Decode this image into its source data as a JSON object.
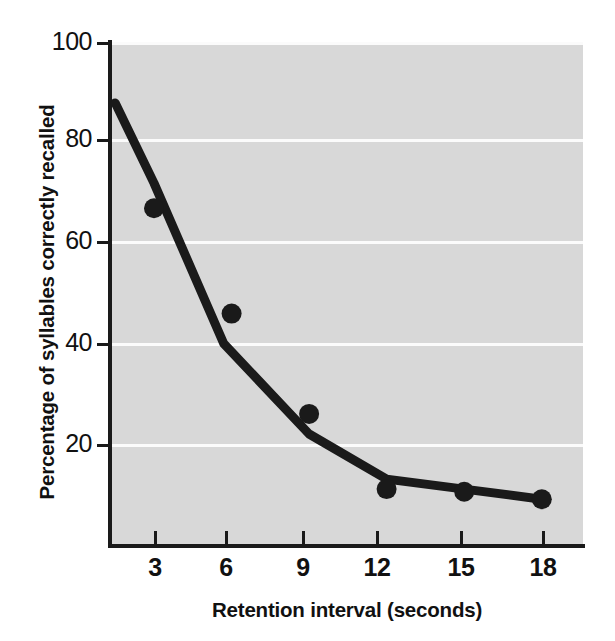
{
  "chart_data": {
    "type": "line",
    "title": "",
    "xlabel": "Retention interval (seconds)",
    "ylabel": "Percentage of syllables correctly recalled",
    "xlim": [
      0,
      19.5
    ],
    "ylim": [
      0,
      100
    ],
    "xticks": [
      3,
      6,
      9,
      12,
      15,
      18
    ],
    "xtick_labels": [
      "3",
      "6",
      "9",
      "12",
      "15",
      "18"
    ],
    "yticks": [
      20,
      40,
      60,
      80,
      100
    ],
    "ytick_labels": [
      "20",
      "40",
      "60",
      "80",
      "100"
    ],
    "grid": "horizontal",
    "legend": "none",
    "plot_background": "#d8d8d8",
    "gridline_color": "#fbfbfb",
    "series_color": "#1a1a1a",
    "series": [
      {
        "name": "Observed data points",
        "marker": "filled-circle",
        "x": [
          3,
          6,
          9,
          12,
          15,
          18
        ],
        "values": [
          67,
          46,
          26,
          11,
          10.5,
          9
        ]
      },
      {
        "name": "Fitted forgetting curve",
        "marker": "none",
        "x": [
          1.5,
          3,
          5.7,
          9,
          12,
          15,
          18
        ],
        "values": [
          88,
          72,
          40,
          22,
          13,
          11,
          9
        ]
      }
    ]
  },
  "axes": {
    "x_title": "Retention interval (seconds)",
    "y_title": "Percentage of syllables correctly recalled"
  }
}
